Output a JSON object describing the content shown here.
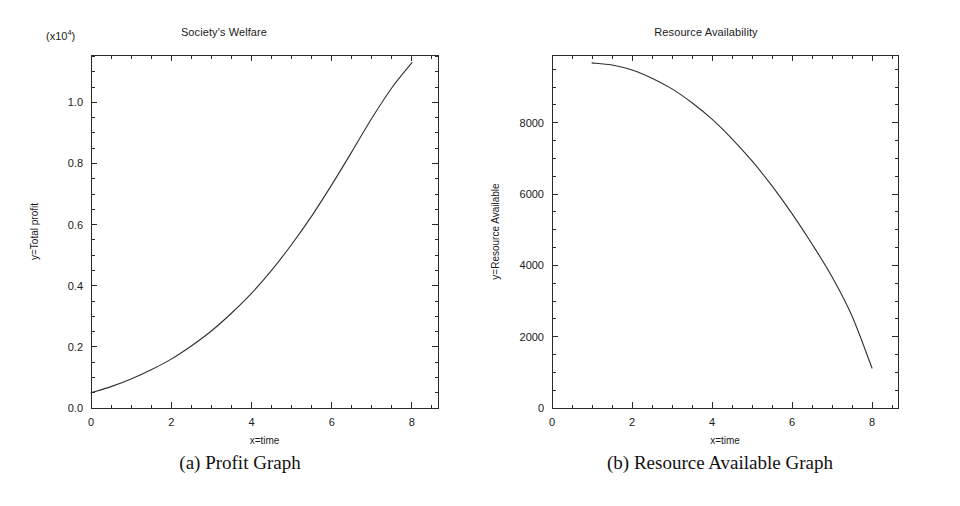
{
  "figure": {
    "panels": [
      {
        "key": "profit",
        "title": "Society's Welfare",
        "exponent_prefix": "(x10",
        "exponent_power": "4",
        "exponent_suffix": ")",
        "caption": "(a) Profit Graph"
      },
      {
        "key": "resource",
        "title": "Resource Availability",
        "caption": "(b) Resource Available Graph"
      }
    ]
  },
  "chart_data": [
    {
      "type": "line",
      "panel": "profit",
      "title": "Society's Welfare",
      "caption": "(a) Profit Graph",
      "xlabel": "x=time",
      "ylabel": "y=Total profit",
      "y_exponent_label": "(x10^4)",
      "y_scale_factor": 10000,
      "xlim": [
        0,
        8.65
      ],
      "ylim": [
        0.0,
        1.155
      ],
      "xticks": [
        0,
        2,
        4,
        6,
        8
      ],
      "xtick_labels": [
        "0",
        "2",
        "4",
        "6",
        "8"
      ],
      "x_minor_step": 0.5,
      "yticks": [
        0.0,
        0.2,
        0.4,
        0.6,
        0.8,
        1.0
      ],
      "ytick_labels": [
        "0.0",
        "0.2",
        "0.4",
        "0.6",
        "0.8",
        "1.0"
      ],
      "y_minor_step": 0.05,
      "grid": false,
      "legend": "none",
      "series": [
        {
          "name": "Total profit",
          "x": [
            0.0,
            0.5,
            1.0,
            1.5,
            2.0,
            2.5,
            3.0,
            3.5,
            4.0,
            4.5,
            5.0,
            5.5,
            6.0,
            6.5,
            7.0,
            7.5,
            8.0
          ],
          "y": [
            0.05,
            0.07,
            0.095,
            0.125,
            0.16,
            0.203,
            0.252,
            0.31,
            0.375,
            0.45,
            0.535,
            0.628,
            0.73,
            0.838,
            0.948,
            1.048,
            1.13
          ]
        }
      ]
    },
    {
      "type": "line",
      "panel": "resource",
      "title": "Resource Availability",
      "caption": "(b) Resource Available Graph",
      "xlabel": "x=time",
      "ylabel": "y=Resource Available",
      "xlim": [
        0,
        8.65
      ],
      "ylim": [
        0,
        9900
      ],
      "xticks": [
        0,
        2,
        4,
        6,
        8
      ],
      "xtick_labels": [
        "0",
        "2",
        "4",
        "6",
        "8"
      ],
      "x_minor_step": 0.5,
      "yticks": [
        0,
        2000,
        4000,
        6000,
        8000
      ],
      "ytick_labels": [
        "0",
        "2000",
        "4000",
        "6000",
        "8000"
      ],
      "y_minor_step": 500,
      "grid": false,
      "legend": "none",
      "series": [
        {
          "name": "Resource Available",
          "x": [
            1.0,
            1.5,
            2.0,
            2.5,
            3.0,
            3.5,
            4.0,
            4.5,
            5.0,
            5.5,
            6.0,
            6.5,
            7.0,
            7.5,
            8.0
          ],
          "y": [
            9680,
            9620,
            9480,
            9250,
            8950,
            8560,
            8100,
            7550,
            6930,
            6230,
            5450,
            4600,
            3680,
            2580,
            1120
          ]
        }
      ]
    }
  ]
}
